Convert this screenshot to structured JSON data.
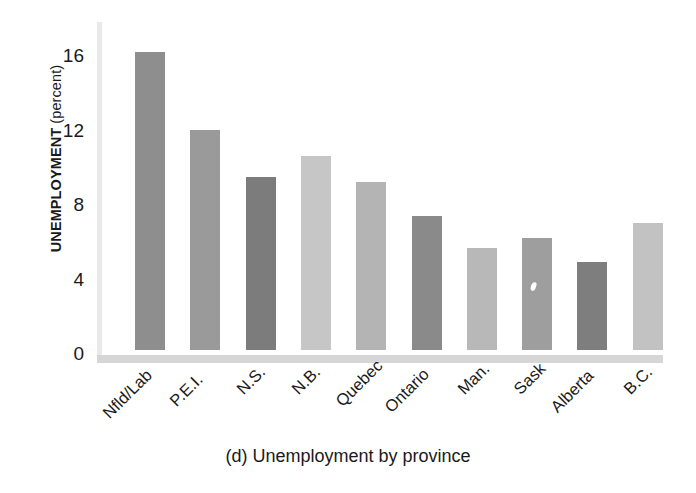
{
  "chart_data": {
    "type": "bar",
    "title": "(d) Unemployment by province",
    "xlabel": "",
    "ylabel": "UNEMPLOYMENT (percent)",
    "ylabel_bold": "UNEMPLOYMENT",
    "ylabel_light": " (percent)",
    "categories": [
      "Nfld/Lab",
      "P.E.I.",
      "N.S.",
      "N.B.",
      "Quebec",
      "Ontario",
      "Man.",
      "Sask",
      "Alberta",
      "B.C."
    ],
    "values": [
      16.0,
      11.8,
      9.3,
      10.4,
      9.0,
      7.2,
      5.5,
      6.0,
      4.7,
      6.8
    ],
    "bar_colors": [
      "#8e8e8e",
      "#9a9a9a",
      "#7c7c7c",
      "#c6c6c6",
      "#b4b4b4",
      "#8a8a8a",
      "#b8b8b8",
      "#9e9e9e",
      "#7e7e7e",
      "#c2c2c2"
    ],
    "ylim": [
      0,
      17.5
    ],
    "yticks": [
      0,
      4,
      8,
      12,
      16
    ],
    "ytick_labels": [
      "0",
      "4",
      "8",
      "12",
      "16"
    ],
    "grid": false,
    "legend": "none",
    "axis_color": "#d6d6d6"
  },
  "caption": {
    "text": "(d) Unemployment by province"
  }
}
